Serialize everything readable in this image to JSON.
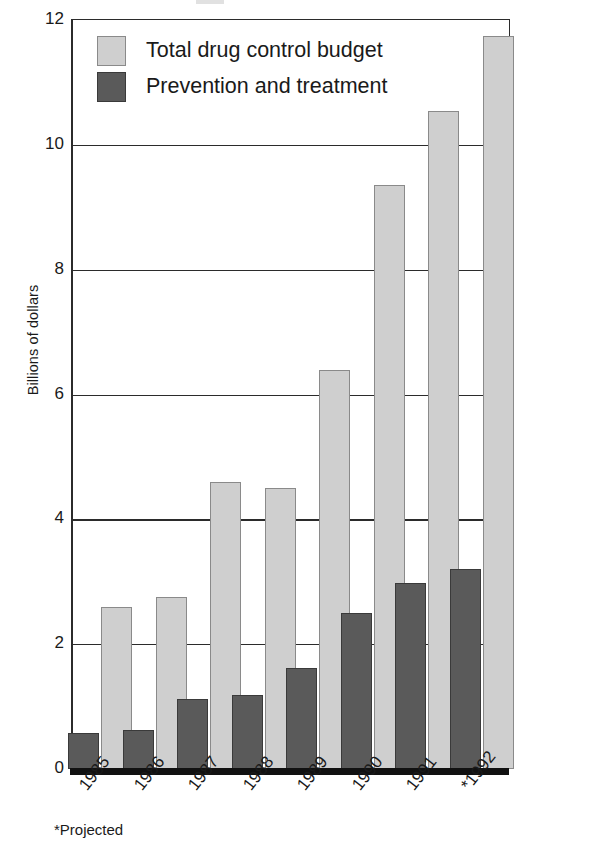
{
  "chart_data": {
    "type": "bar",
    "title": "",
    "xlabel": "",
    "ylabel": "Billions of dollars",
    "categories": [
      "1985",
      "1986",
      "1987",
      "1988",
      "1989",
      "1990",
      "1991",
      "*1992"
    ],
    "series": [
      {
        "name": "Total drug control budget",
        "color": "#cfcfcf",
        "values": [
          2.6,
          2.75,
          4.6,
          4.5,
          6.4,
          9.35,
          10.55,
          11.75
        ]
      },
      {
        "name": "Prevention and treatment",
        "color": "#5a5a5a",
        "values": [
          0.57,
          0.62,
          1.12,
          1.18,
          1.62,
          2.5,
          2.98,
          3.2
        ]
      }
    ],
    "ylim": [
      0,
      12
    ],
    "yticks": [
      0,
      2,
      4,
      6,
      8,
      10,
      12
    ],
    "ytick_labels": [
      "0",
      "2",
      "4",
      "6",
      "8",
      "10",
      "12"
    ],
    "grid": true,
    "grid_axis": "y",
    "legend_position": "top-left-inside",
    "annotations": [
      "*Projected"
    ]
  },
  "legend": {
    "items": [
      {
        "label": "Total drug control budget",
        "swatch": "total"
      },
      {
        "label": "Prevention and treatment",
        "swatch": "prev"
      }
    ]
  },
  "footnote": {
    "text": "*Projected"
  }
}
